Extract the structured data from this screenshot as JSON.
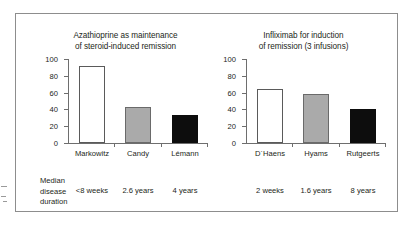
{
  "figure": {
    "median_caption_lines": [
      "Median",
      "disease",
      "duration"
    ]
  },
  "chart_data": {
    "type": "bar",
    "title": "",
    "panels": [
      {
        "id": "azathioprine",
        "title_lines": [
          "Azathioprine as maintenance",
          "of steroid-induced remission"
        ],
        "title": "Azathioprine as maintenance of steroid-induced remission",
        "ylabel": "",
        "xlabel": "",
        "ylim": [
          0,
          100
        ],
        "yticks": [
          0,
          20,
          40,
          60,
          80,
          100
        ],
        "grid": false,
        "categories": [
          "Markowitz",
          "Candy",
          "Lémann"
        ],
        "values": [
          92,
          43,
          33
        ],
        "bar_styles": [
          "white",
          "gray",
          "black"
        ],
        "annotations": [
          "<8 weeks",
          "2.6 years",
          "4 years"
        ]
      },
      {
        "id": "infliximab",
        "title_lines": [
          "Infliximab for induction",
          "of remission (3 infusions)"
        ],
        "title": "Infliximab for induction of remission (3 infusions)",
        "ylabel": "",
        "xlabel": "",
        "ylim": [
          0,
          100
        ],
        "yticks": [
          0,
          20,
          40,
          60,
          80,
          100
        ],
        "grid": false,
        "categories": [
          "D´Haens",
          "Hyams",
          "Rutgeerts"
        ],
        "values": [
          64,
          58,
          41
        ],
        "bar_styles": [
          "white",
          "gray",
          "black"
        ],
        "annotations": [
          "2 weeks",
          "1.6 years",
          "8 years"
        ]
      }
    ],
    "annotation_row_label": "Median disease duration",
    "legend": [],
    "colors": {
      "bar_white": "#ffffff",
      "bar_gray": "#aaaaaa",
      "bar_black": "#0d0d0d",
      "axis": "#6e6e6e",
      "frame": "#8d8d8d",
      "text": "#231f20"
    }
  }
}
